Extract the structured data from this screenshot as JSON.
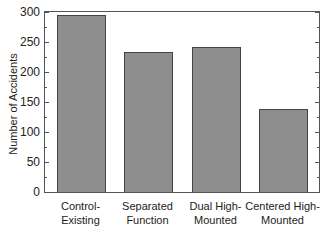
{
  "chart_data": {
    "type": "bar",
    "title": "",
    "xlabel": "",
    "ylabel": "Number of Accidents",
    "ylim": [
      0,
      300
    ],
    "yticks": [
      0,
      50,
      100,
      150,
      200,
      250,
      300
    ],
    "grid": false,
    "legend": null,
    "categories": [
      "Control-Existing",
      "Separated Function",
      "Dual High-Mounted",
      "Centered High-Mounted"
    ],
    "category_lines": [
      [
        "Control-",
        "Existing"
      ],
      [
        "Separated",
        "Function"
      ],
      [
        "Dual High-",
        "Mounted"
      ],
      [
        "Centered High-",
        "Mounted"
      ]
    ],
    "values": [
      295,
      233,
      242,
      138
    ],
    "bar_color": "#8e8e8e"
  }
}
